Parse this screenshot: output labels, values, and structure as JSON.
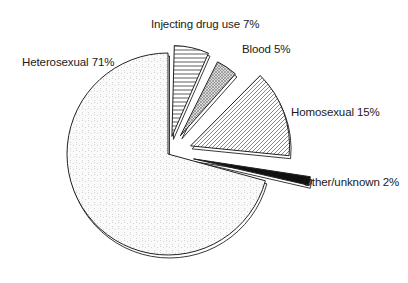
{
  "chart_data": {
    "type": "pie",
    "title": "",
    "style": "exploded 3D-effect pie with hatch patterns",
    "categories": [
      "Injecting drug use",
      "Blood",
      "Homosexual",
      "Other/unknown",
      "Heterosexual"
    ],
    "values": [
      7,
      5,
      15,
      2,
      71
    ],
    "unit": "%",
    "labels": [
      {
        "text": "Injecting drug use 7%",
        "pattern": "horizontal-lines"
      },
      {
        "text": "Blood 5%",
        "pattern": "crosshatch"
      },
      {
        "text": "Homosexual 15%",
        "pattern": "diagonal-lines"
      },
      {
        "text": "Other/unknown 2%",
        "pattern": "solid-black"
      },
      {
        "text": "Heterosexual 71%",
        "pattern": "light-dots"
      }
    ],
    "legend": "none (labels beside slices)"
  }
}
